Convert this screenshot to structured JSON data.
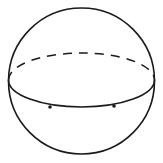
{
  "diagram": {
    "stroke_color": "#1a1a1a",
    "background": "#ffffff",
    "outline": {
      "cx": 81.5,
      "cy": 81,
      "r": 73
    },
    "equator": {
      "cx": 81.5,
      "cy": 80,
      "rx": 73,
      "ry": 27
    },
    "points": [
      {
        "x": 50,
        "y": 107
      },
      {
        "x": 114,
        "y": 106
      }
    ]
  }
}
